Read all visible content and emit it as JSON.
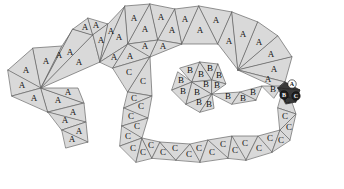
{
  "figure": {
    "width": 344,
    "height": 189,
    "background_color": "#ffffff",
    "face_fill_color": "#d9d9d9",
    "face_stroke_color": "#666666",
    "face_stroke_width": 0.7,
    "highlight_fill_color": "#3a3a3a",
    "highlight_stroke_color": "#222222",
    "label_color": "#111111",
    "marker_light_fill": "#ffffff",
    "marker_dark_fill": "#222222"
  },
  "chart_data": {
    "type": "diagram",
    "legend": [
      "A",
      "B",
      "C"
    ],
    "region_counts": {
      "A": 28,
      "B": 15,
      "C": 24
    },
    "markers": [
      "A",
      "B",
      "C"
    ]
  },
  "faces": [
    {
      "id": "a01",
      "label": "A",
      "points": "8,70 33,48 41,88",
      "cx": 26,
      "cy": 71
    },
    {
      "id": "a02",
      "label": "A",
      "points": "33,48 62,46 41,88",
      "cx": 46,
      "cy": 62
    },
    {
      "id": "a03",
      "label": "A",
      "points": "62,46 73,29 41,88",
      "cx": 59,
      "cy": 56
    },
    {
      "id": "a04",
      "label": "A",
      "points": "73,29 93,35 41,88",
      "cx": 70,
      "cy": 53
    },
    {
      "id": "a05",
      "label": "A",
      "points": "93,35 100,62 41,88",
      "cx": 79,
      "cy": 63
    },
    {
      "id": "a06",
      "label": "A",
      "points": "73,29 88,18 93,35",
      "cx": 85,
      "cy": 28
    },
    {
      "id": "a07",
      "label": "A",
      "points": "88,18 108,24 93,35",
      "cx": 96,
      "cy": 26
    },
    {
      "id": "a08",
      "label": "A",
      "points": "108,24 100,62 93,35",
      "cx": 101,
      "cy": 41
    },
    {
      "id": "a09",
      "label": "A",
      "points": "108,24 125,6 100,62",
      "cx": 111,
      "cy": 32
    },
    {
      "id": "a10",
      "label": "A",
      "points": "125,6 128,44 100,62",
      "cx": 119,
      "cy": 38
    },
    {
      "id": "a11",
      "label": "A",
      "points": "125,6 150,4 128,44",
      "cx": 134,
      "cy": 19
    },
    {
      "id": "a12",
      "label": "A",
      "points": "150,4 158,40 128,44",
      "cx": 145,
      "cy": 30
    },
    {
      "id": "a13",
      "label": "A",
      "points": "150,4 175,9 158,40",
      "cx": 161,
      "cy": 18
    },
    {
      "id": "a14",
      "label": "A",
      "points": "175,9 182,44 158,40",
      "cx": 172,
      "cy": 31
    },
    {
      "id": "a15",
      "label": "A",
      "points": "128,44 158,40 150,57",
      "cx": 145,
      "cy": 47
    },
    {
      "id": "a16",
      "label": "A",
      "points": "158,40 182,44 150,57",
      "cx": 163,
      "cy": 47
    },
    {
      "id": "a17",
      "label": "A",
      "points": "100,62 128,44 113,68",
      "cx": 114,
      "cy": 58
    },
    {
      "id": "a18",
      "label": "A",
      "points": "128,44 150,57 113,68",
      "cx": 130,
      "cy": 57
    },
    {
      "id": "a19",
      "label": "A",
      "points": "175,9 199,6 182,44",
      "cx": 185,
      "cy": 20
    },
    {
      "id": "a20",
      "label": "A",
      "points": "199,6 218,44 182,44",
      "cx": 200,
      "cy": 31
    },
    {
      "id": "a21",
      "label": "A",
      "points": "199,6 232,12 218,44",
      "cx": 216,
      "cy": 21
    },
    {
      "id": "a22",
      "label": "A",
      "points": "232,12 238,70 218,44",
      "cx": 229,
      "cy": 42
    },
    {
      "id": "a23",
      "label": "A",
      "points": "232,12 258,22 238,70",
      "cx": 243,
      "cy": 35
    },
    {
      "id": "a24",
      "label": "A",
      "points": "258,22 278,36 238,70",
      "cx": 259,
      "cy": 43
    },
    {
      "id": "a25",
      "label": "A",
      "points": "278,36 292,57 238,70",
      "cx": 271,
      "cy": 55
    },
    {
      "id": "a26",
      "label": "A",
      "points": "292,57 285,82 238,70",
      "cx": 274,
      "cy": 70
    },
    {
      "id": "a27",
      "label": "A",
      "points": "238,70 285,82 278,88",
      "cx": 268,
      "cy": 80
    },
    {
      "id": "a28",
      "label": "A",
      "points": "8,70 41,88 12,96",
      "cx": 22,
      "cy": 86
    },
    {
      "id": "a29",
      "label": "A",
      "points": "12,96 41,88 48,112",
      "cx": 34,
      "cy": 99
    },
    {
      "id": "a30",
      "label": "A",
      "points": "41,88 84,103 48,112",
      "cx": 58,
      "cy": 101
    },
    {
      "id": "a31",
      "label": "A",
      "points": "41,88 78,88 84,103",
      "cx": 68,
      "cy": 93
    },
    {
      "id": "a32",
      "label": "A",
      "points": "48,112 84,103 86,122",
      "cx": 73,
      "cy": 113
    },
    {
      "id": "a33",
      "label": "A",
      "points": "48,112 86,122 62,130",
      "cx": 65,
      "cy": 121
    },
    {
      "id": "a34",
      "label": "A",
      "points": "62,130 86,122 88,142",
      "cx": 79,
      "cy": 132
    },
    {
      "id": "a35",
      "label": "A",
      "points": "62,130 88,142 66,148",
      "cx": 72,
      "cy": 140
    },
    {
      "id": "b01",
      "label": "B",
      "points": "180,68 200,62 192,82",
      "cx": 190,
      "cy": 71
    },
    {
      "id": "b02",
      "label": "B",
      "points": "200,62 212,80 192,82",
      "cx": 201,
      "cy": 75
    },
    {
      "id": "b03",
      "label": "B",
      "points": "200,62 218,64 212,80",
      "cx": 210,
      "cy": 69
    },
    {
      "id": "b04",
      "label": "B",
      "points": "218,64 226,84 212,80",
      "cx": 219,
      "cy": 76
    },
    {
      "id": "b05",
      "label": "B",
      "points": "178,72 192,82 172,90",
      "cx": 181,
      "cy": 81
    },
    {
      "id": "b06",
      "label": "B",
      "points": "172,90 192,82 186,104",
      "cx": 183,
      "cy": 92
    },
    {
      "id": "b07",
      "label": "B",
      "points": "186,104 192,82 212,94",
      "cx": 197,
      "cy": 93
    },
    {
      "id": "b08",
      "label": "B",
      "points": "192,82 212,80 212,94",
      "cx": 206,
      "cy": 85
    },
    {
      "id": "b09",
      "label": "B",
      "points": "212,80 226,84 212,94",
      "cx": 217,
      "cy": 86
    },
    {
      "id": "b10",
      "label": "B",
      "points": "186,104 212,94 200,112",
      "cx": 199,
      "cy": 103
    },
    {
      "id": "b11",
      "label": "B",
      "points": "200,112 212,94 214,108",
      "cx": 209,
      "cy": 105
    },
    {
      "id": "b12",
      "label": "B",
      "points": "212,94 240,92 232,104",
      "cx": 228,
      "cy": 97
    },
    {
      "id": "b13",
      "label": "B",
      "points": "240,92 262,86 256,100",
      "cx": 253,
      "cy": 93
    },
    {
      "id": "b14",
      "label": "B",
      "points": "232,104 240,92 256,100",
      "cx": 243,
      "cy": 99
    },
    {
      "id": "b15",
      "label": "B",
      "points": "262,86 282,86 274,98",
      "cx": 273,
      "cy": 90
    },
    {
      "id": "c01",
      "label": "C",
      "points": "113,68 150,57 128,92",
      "cx": 129,
      "cy": 73
    },
    {
      "id": "c02",
      "label": "C",
      "points": "150,57 152,96 128,92",
      "cx": 143,
      "cy": 82
    },
    {
      "id": "c03",
      "label": "C",
      "points": "128,92 152,96 124,108",
      "cx": 134,
      "cy": 99
    },
    {
      "id": "c04",
      "label": "C",
      "points": "124,108 152,96 148,118",
      "cx": 141,
      "cy": 107
    },
    {
      "id": "c05",
      "label": "C",
      "points": "124,108 148,118 122,126",
      "cx": 131,
      "cy": 117
    },
    {
      "id": "c06",
      "label": "C",
      "points": "122,126 148,118 142,138",
      "cx": 137,
      "cy": 127
    },
    {
      "id": "c07",
      "label": "C",
      "points": "122,126 142,138 120,146",
      "cx": 128,
      "cy": 137
    },
    {
      "id": "c08",
      "label": "C",
      "points": "120,146 142,138 136,162",
      "cx": 133,
      "cy": 149
    },
    {
      "id": "c09",
      "label": "C",
      "points": "136,162 142,138 152,158",
      "cx": 143,
      "cy": 153
    },
    {
      "id": "c10",
      "label": "C",
      "points": "142,138 160,142 152,158",
      "cx": 151,
      "cy": 146
    },
    {
      "id": "c11",
      "label": "C",
      "points": "152,158 160,142 176,160",
      "cx": 163,
      "cy": 153
    },
    {
      "id": "c12",
      "label": "C",
      "points": "160,142 190,144 176,160",
      "cx": 175,
      "cy": 149
    },
    {
      "id": "c13",
      "label": "C",
      "points": "190,144 208,140 200,162",
      "cx": 199,
      "cy": 149
    },
    {
      "id": "c14",
      "label": "C",
      "points": "176,160 190,144 200,162",
      "cx": 189,
      "cy": 155
    },
    {
      "id": "c15",
      "label": "C",
      "points": "208,140 232,136 228,158",
      "cx": 223,
      "cy": 145
    },
    {
      "id": "c16",
      "label": "C",
      "points": "200,162 208,140 228,158",
      "cx": 212,
      "cy": 153
    },
    {
      "id": "c17",
      "label": "C",
      "points": "232,136 258,136 246,160",
      "cx": 245,
      "cy": 144
    },
    {
      "id": "c18",
      "label": "C",
      "points": "228,158 232,136 246,160",
      "cx": 235,
      "cy": 151
    },
    {
      "id": "c19",
      "label": "C",
      "points": "258,136 280,130 272,152",
      "cx": 270,
      "cy": 139
    },
    {
      "id": "c20",
      "label": "C",
      "points": "246,160 258,136 272,152",
      "cx": 259,
      "cy": 149
    },
    {
      "id": "c21",
      "label": "C",
      "points": "280,130 296,114 290,140",
      "cx": 289,
      "cy": 128
    },
    {
      "id": "c22",
      "label": "C",
      "points": "272,152 280,130 290,140",
      "cx": 281,
      "cy": 141
    },
    {
      "id": "c23",
      "label": "C",
      "points": "285,82 296,114 278,108",
      "cx": 287,
      "cy": 101
    },
    {
      "id": "c24",
      "label": "C",
      "points": "278,108 296,114 280,130",
      "cx": 285,
      "cy": 117
    }
  ],
  "highlight_faces": [
    {
      "id": "h01",
      "points": "285,82 300,90 278,88",
      "label": ""
    },
    {
      "id": "h02",
      "points": "278,88 300,90 296,102",
      "label": ""
    },
    {
      "id": "h03",
      "points": "278,88 296,102 286,104",
      "label": ""
    }
  ],
  "markers": [
    {
      "id": "m-a",
      "label": "A",
      "cx": 292,
      "cy": 84,
      "r": 4.2,
      "fill": "#ffffff",
      "text_color": "#111111"
    },
    {
      "id": "m-b",
      "label": "B",
      "cx": 284,
      "cy": 95,
      "r": 4.2,
      "fill": "#222222",
      "text_color": "#ffffff"
    },
    {
      "id": "m-c",
      "label": "C",
      "cx": 296,
      "cy": 96,
      "r": 4.2,
      "fill": "#222222",
      "text_color": "#ffffff"
    }
  ]
}
